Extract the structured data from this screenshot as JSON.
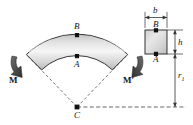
{
  "figure": {
    "type": "curved-beam-pure-bending-diagram",
    "labels": {
      "point_b_arc": "B",
      "point_a_arc": "A",
      "center_c": "C",
      "moment_left": "M",
      "moment_right": "M′",
      "point_b_section": "B",
      "point_a_section": "A",
      "width_b": "b",
      "height_h": "h",
      "radius_r1": "r",
      "radius_r1_sub": "1"
    },
    "colors": {
      "outline": "#1a1a1a",
      "arrow_fill": "#4d4d4d",
      "body_light": "#fdfdfd",
      "body_mid": "#d8d8d8",
      "body_dark": "#b0b0b0",
      "dash": "#555555",
      "dimension": "#333333",
      "background": "#ffffff"
    },
    "geometry": {
      "center_x": 77,
      "center_y": 107,
      "outer_radius": 73,
      "inner_radius": 51,
      "half_angle_deg": 46,
      "section_left": 145,
      "section_top": 30,
      "section_size": 22
    }
  }
}
